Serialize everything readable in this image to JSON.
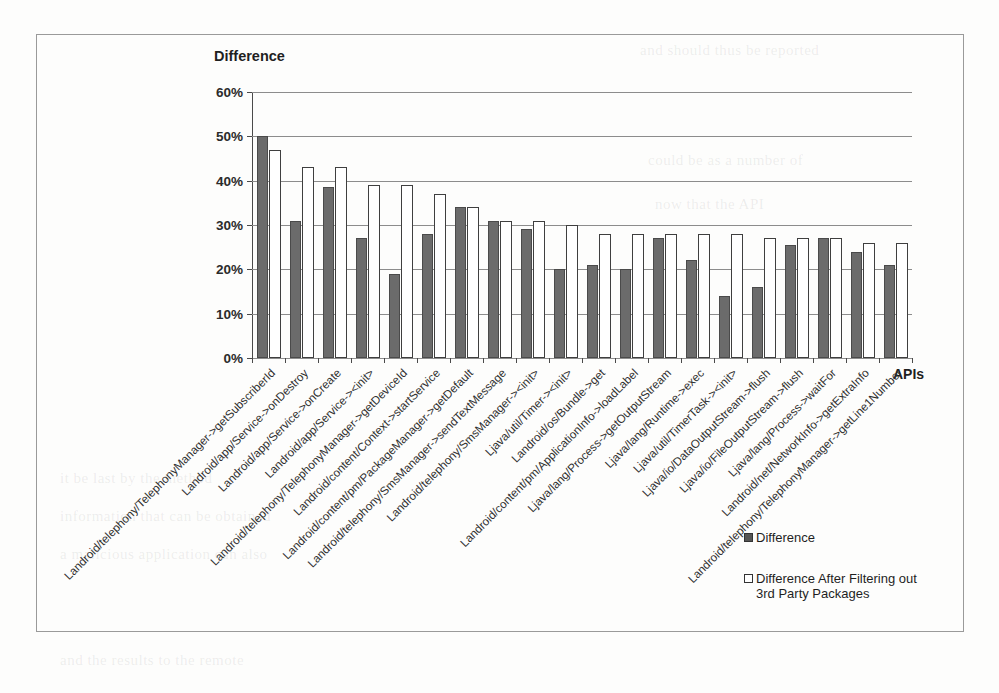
{
  "chart_data": {
    "type": "bar",
    "title": "",
    "ylabel": "Difference",
    "xlabel": "APIs",
    "ylim": [
      0,
      60
    ],
    "ytick_labels": [
      "60%",
      "50%",
      "40%",
      "30%",
      "20%",
      "10%",
      "0%"
    ],
    "ytick_values": [
      60,
      50,
      40,
      30,
      20,
      10,
      0
    ],
    "grid": true,
    "legend_position": "bottom-right",
    "categories": [
      "Landroid/telephony/TelephonyManager->getSubscriberId",
      "Landroid/app/Service->onDestroy",
      "Landroid/app/Service->onCreate",
      "Landroid/app/Service-><init>",
      "Landroid/telephony/TelephonyManager->getDeviceId",
      "Landroid/content/Context->startService",
      "Landroid/content/pm/PackageManager->getDefault",
      "Landroid/telephony/SmsManager->sendTextMessage",
      "Landroid/telephony/SmsManager-><init>",
      "Ljava/util/Timer-><init>",
      "Landroid/os/Bundle->get",
      "Landroid/content/pm/ApplicationInfo->loadLabel",
      "Ljava/lang/Process->getOutputStream",
      "Ljava/lang/Runtime->exec",
      "Ljava/util/TimerTask-><init>",
      "Ljava/io/DataOutputStream->flush",
      "Ljava/io/FileOutputStream->flush",
      "Ljava/lang/Process->waitFor",
      "Landroid/net/NetworkInfo->getExtraInfo",
      "Landroid/telephony/TelephonyManager->getLine1Number"
    ],
    "series": [
      {
        "name": "Difference",
        "color": "#6b6b6b",
        "values": [
          50,
          31,
          38.5,
          27,
          19,
          28,
          34,
          31,
          29,
          20,
          21,
          20,
          27,
          22,
          14,
          16,
          25.5,
          27,
          24,
          21
        ]
      },
      {
        "name": "Difference After Filtering out 3rd Party Packages",
        "color": "#ffffff",
        "values": [
          47,
          43,
          43,
          39,
          39,
          37,
          34,
          31,
          31,
          30,
          28,
          28,
          28,
          28,
          28,
          27,
          27,
          27,
          26,
          26
        ]
      }
    ]
  },
  "axis": {
    "y_title": "Difference",
    "x_title": "APIs"
  },
  "legend": {
    "items": [
      {
        "label": "Difference",
        "swatch": "filled-gray"
      },
      {
        "label": "Difference After Filtering out 3rd Party Packages",
        "swatch": "outline-white"
      }
    ]
  },
  "bleed_text": {
    "lines": [
      "and should thus be reported",
      "could be as a number of",
      "now that the API",
      "it be last by the method",
      "information that can be obtained",
      "a malicious application can also",
      "and the results to the remote"
    ]
  }
}
